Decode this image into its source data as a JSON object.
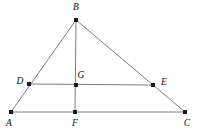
{
  "figure": {
    "background_color": "#ffffff",
    "line_color": "#7d7d7d",
    "vertex_color": "#1a1a1a",
    "label_color": "#111111",
    "canvas": {
      "width": 198,
      "height": 132
    }
  },
  "points": [
    {
      "id": "A",
      "label": "A",
      "x": 11,
      "y": 112,
      "label_x": 9,
      "label_y": 124,
      "anchor": "middle"
    },
    {
      "id": "B",
      "label": "B",
      "x": 76,
      "y": 20,
      "label_x": 76,
      "label_y": 8,
      "anchor": "middle"
    },
    {
      "id": "C",
      "label": "C",
      "x": 185,
      "y": 112,
      "label_x": 187,
      "label_y": 124,
      "anchor": "middle"
    },
    {
      "id": "D",
      "label": "D",
      "x": 29,
      "y": 84,
      "label_x": 20,
      "label_y": 82,
      "anchor": "middle"
    },
    {
      "id": "E",
      "label": "E",
      "x": 153,
      "y": 85,
      "label_x": 164,
      "label_y": 83,
      "anchor": "middle"
    },
    {
      "id": "F",
      "label": "F",
      "x": 75,
      "y": 112,
      "label_x": 75,
      "label_y": 124,
      "anchor": "middle"
    },
    {
      "id": "G",
      "label": "G",
      "x": 76,
      "y": 85,
      "label_x": 81,
      "label_y": 76,
      "anchor": "middle"
    }
  ],
  "segments": [
    {
      "id": "AB",
      "from": "A",
      "to": "B",
      "x1": 11,
      "y1": 112,
      "x2": 76,
      "y2": 20
    },
    {
      "id": "BC",
      "from": "B",
      "to": "C",
      "x1": 76,
      "y1": 20,
      "x2": 185,
      "y2": 112
    },
    {
      "id": "AC",
      "from": "A",
      "to": "C",
      "x1": 11,
      "y1": 112,
      "x2": 185,
      "y2": 112
    },
    {
      "id": "BF",
      "from": "B",
      "to": "F",
      "x1": 76,
      "y1": 20,
      "x2": 75,
      "y2": 112
    },
    {
      "id": "DE",
      "from": "D",
      "to": "E",
      "x1": 29,
      "y1": 84,
      "x2": 153,
      "y2": 85
    }
  ]
}
